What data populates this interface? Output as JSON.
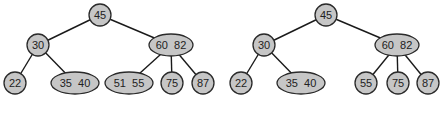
{
  "trees": [
    {
      "name": "before",
      "nodes": [
        {
          "id": "n45",
          "label": "45",
          "cx": 100,
          "cy": 15,
          "rx": 11,
          "ry": 11
        },
        {
          "id": "n30",
          "label": "30",
          "cx": 38,
          "cy": 45,
          "rx": 11,
          "ry": 11
        },
        {
          "id": "n6082",
          "label": "60  82",
          "cx": 171,
          "cy": 45,
          "rx": 22,
          "ry": 11
        },
        {
          "id": "n22",
          "label": "22",
          "cx": 15,
          "cy": 83,
          "rx": 11,
          "ry": 11
        },
        {
          "id": "n3540",
          "label": "35  40",
          "cx": 75,
          "cy": 83,
          "rx": 24,
          "ry": 11
        },
        {
          "id": "n5155",
          "label": "51  55",
          "cx": 129,
          "cy": 83,
          "rx": 24,
          "ry": 11
        },
        {
          "id": "n75",
          "label": "75",
          "cx": 172,
          "cy": 83,
          "rx": 11,
          "ry": 11
        },
        {
          "id": "n87",
          "label": "87",
          "cx": 203,
          "cy": 83,
          "rx": 11,
          "ry": 11
        }
      ],
      "edges": [
        [
          "n45",
          "n30"
        ],
        [
          "n45",
          "n6082"
        ],
        [
          "n30",
          "n22"
        ],
        [
          "n30",
          "n3540"
        ],
        [
          "n6082",
          "n5155"
        ],
        [
          "n6082",
          "n75"
        ],
        [
          "n6082",
          "n87"
        ]
      ]
    },
    {
      "name": "after",
      "nodes": [
        {
          "id": "m45",
          "label": "45",
          "cx": 326,
          "cy": 15,
          "rx": 11,
          "ry": 11
        },
        {
          "id": "m30",
          "label": "30",
          "cx": 264,
          "cy": 45,
          "rx": 11,
          "ry": 11
        },
        {
          "id": "m6082",
          "label": "60  82",
          "cx": 397,
          "cy": 45,
          "rx": 22,
          "ry": 11
        },
        {
          "id": "m22",
          "label": "22",
          "cx": 241,
          "cy": 83,
          "rx": 11,
          "ry": 11
        },
        {
          "id": "m3540",
          "label": "35  40",
          "cx": 301,
          "cy": 83,
          "rx": 24,
          "ry": 11
        },
        {
          "id": "m55",
          "label": "55",
          "cx": 366,
          "cy": 83,
          "rx": 11,
          "ry": 11
        },
        {
          "id": "m75",
          "label": "75",
          "cx": 398,
          "cy": 83,
          "rx": 11,
          "ry": 11
        },
        {
          "id": "m87",
          "label": "87",
          "cx": 428,
          "cy": 83,
          "rx": 11,
          "ry": 11
        }
      ],
      "edges": [
        [
          "m45",
          "m30"
        ],
        [
          "m45",
          "m6082"
        ],
        [
          "m30",
          "m22"
        ],
        [
          "m30",
          "m3540"
        ],
        [
          "m6082",
          "m55"
        ],
        [
          "m6082",
          "m75"
        ],
        [
          "m6082",
          "m87"
        ]
      ]
    }
  ]
}
